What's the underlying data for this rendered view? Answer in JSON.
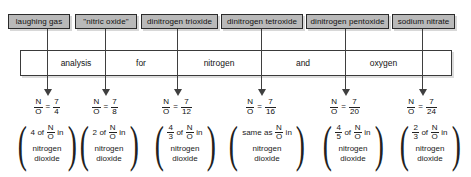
{
  "diagram": {
    "sentence_band": {
      "words": [
        "analysis",
        "for",
        "nitrogen",
        "and",
        "oxygen"
      ]
    },
    "columns": [
      {
        "compound": "laughing gas",
        "ratio": {
          "label": "N",
          "over": "O",
          "equals": "=",
          "numerator": "7",
          "denominator": "4"
        },
        "note": {
          "multiplier_whole": "4",
          "multiplier_num": "",
          "multiplier_den": "",
          "connector": "of",
          "symbol_num": "N",
          "symbol_den": "O",
          "preposition": "in",
          "substance": "nitrogen\ndioxide",
          "substance_line1": "nitrogen",
          "substance_line2": "dioxide"
        }
      },
      {
        "compound": "\"nitric oxide\"",
        "ratio": {
          "label": "N",
          "over": "O",
          "equals": "=",
          "numerator": "7",
          "denominator": "8"
        },
        "note": {
          "multiplier_whole": "2",
          "multiplier_num": "",
          "multiplier_den": "",
          "connector": "of",
          "symbol_num": "N",
          "symbol_den": "O",
          "preposition": "in",
          "substance_line1": "nitrogen",
          "substance_line2": "dioxide"
        }
      },
      {
        "compound": "dinitrogen trioxide",
        "ratio": {
          "label": "N",
          "over": "O",
          "equals": "=",
          "numerator": "7",
          "denominator": "12"
        },
        "note": {
          "multiplier_whole": "",
          "multiplier_num": "4",
          "multiplier_den": "3",
          "connector": "of",
          "symbol_num": "N",
          "symbol_den": "O",
          "preposition": "in",
          "substance_line1": "nitrogen",
          "substance_line2": "dioxide"
        }
      },
      {
        "compound": "dinitrogen tetroxide",
        "ratio": {
          "label": "N",
          "over": "O",
          "equals": "=",
          "numerator": "7",
          "denominator": "16"
        },
        "note": {
          "multiplier_whole": "",
          "multiplier_num": "",
          "multiplier_den": "",
          "connector": "same as",
          "symbol_num": "N",
          "symbol_den": "O",
          "preposition": "in",
          "substance_line1": "nitrogen",
          "substance_line2": "dioxide"
        }
      },
      {
        "compound": "dinitrogen pentoxide",
        "ratio": {
          "label": "N",
          "over": "O",
          "equals": "=",
          "numerator": "7",
          "denominator": "20"
        },
        "note": {
          "multiplier_whole": "",
          "multiplier_num": "4",
          "multiplier_den": "5",
          "connector": "of",
          "symbol_num": "N",
          "symbol_den": "O",
          "preposition": "in",
          "substance_line1": "nitrogen",
          "substance_line2": "dioxide"
        }
      },
      {
        "compound": "sodium nitrate",
        "ratio": {
          "label": "N",
          "over": "O",
          "equals": "=",
          "numerator": "7",
          "denominator": "24"
        },
        "note": {
          "multiplier_whole": "",
          "multiplier_num": "2",
          "multiplier_den": "3",
          "connector": "of",
          "symbol_num": "N",
          "symbol_den": "O",
          "preposition": "in",
          "substance_line1": "nitrogen",
          "substance_line2": "dioxide"
        }
      }
    ],
    "colors": {
      "box_fill": "#b9b9b9",
      "box_border": "#2b2b2b",
      "line": "#3f3f3f",
      "shadow": "#d8d8d8",
      "background": "#ffffff"
    }
  }
}
